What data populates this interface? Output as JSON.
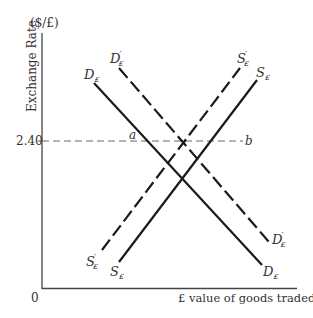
{
  "diagram": {
    "y_axis": {
      "label": "Exchange Rate",
      "unit": "($/£)"
    },
    "x_axis": {
      "label": "£ value of goods traded",
      "origin": "0"
    },
    "price_level": {
      "value": "2.40"
    },
    "points": {
      "a": "a",
      "b": "b"
    },
    "curves": {
      "demand": {
        "symbol": "D",
        "sub": "£",
        "prime": ""
      },
      "demand_shifted": {
        "symbol": "D",
        "sub": "£",
        "prime": "′"
      },
      "supply": {
        "symbol": "S",
        "sub": "£",
        "prime": ""
      },
      "supply_shifted": {
        "symbol": "S",
        "sub": "£",
        "prime": "′"
      }
    },
    "colors": {
      "line": "#1a1a1a",
      "axis": "#444444",
      "text": "#333333"
    }
  }
}
